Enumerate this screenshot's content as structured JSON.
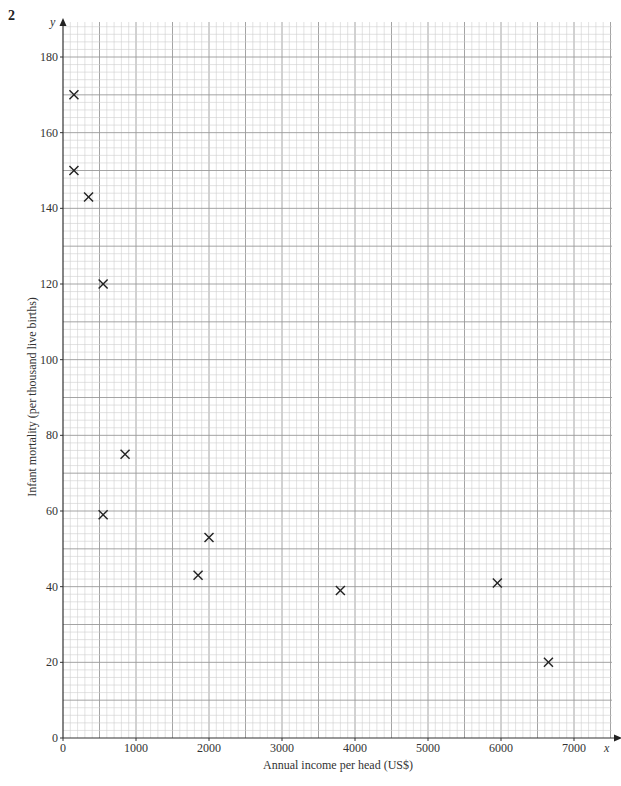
{
  "question_number": "2",
  "chart_data": {
    "type": "scatter",
    "title": "",
    "xlabel": "Annual income per head (US$)",
    "ylabel": "Infant mortality (per thousand live births)",
    "x_axis_var": "x",
    "y_axis_var": "y",
    "xlim": [
      0,
      7500
    ],
    "ylim": [
      0,
      190
    ],
    "x_ticks": [
      0,
      1000,
      2000,
      3000,
      4000,
      5000,
      6000,
      7000
    ],
    "y_ticks": [
      0,
      20,
      40,
      60,
      80,
      100,
      120,
      140,
      160,
      180
    ],
    "grid": true,
    "marker": "x",
    "points": [
      {
        "x": 150,
        "y": 170
      },
      {
        "x": 150,
        "y": 150
      },
      {
        "x": 350,
        "y": 143
      },
      {
        "x": 550,
        "y": 120
      },
      {
        "x": 850,
        "y": 75
      },
      {
        "x": 550,
        "y": 59
      },
      {
        "x": 2000,
        "y": 53
      },
      {
        "x": 1850,
        "y": 43
      },
      {
        "x": 3800,
        "y": 39
      },
      {
        "x": 5950,
        "y": 41
      },
      {
        "x": 6650,
        "y": 20
      }
    ]
  }
}
